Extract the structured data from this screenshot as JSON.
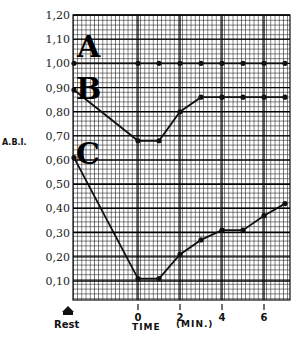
{
  "chart_data": {
    "type": "line",
    "title": "",
    "xlabel": "TIME",
    "xlabel_units": "(MIN.)",
    "ylabel": "A.B.I.",
    "ylim": [
      0.0,
      1.2
    ],
    "xlim": [
      -3,
      7.3
    ],
    "grid": true,
    "legend_position": "inline-left",
    "y_ticks": [
      "0.10",
      "0.20",
      "0.30",
      "0.40",
      "0.50",
      "0.60",
      "0.70",
      "0.80",
      "0.90",
      "1.00",
      "1.10",
      "1.20"
    ],
    "x_ticks": [
      {
        "label": "Rest",
        "value": -3
      },
      {
        "label": "0",
        "value": 0
      },
      {
        "label": "2",
        "value": 2
      },
      {
        "label": "4",
        "value": 4
      },
      {
        "label": "6",
        "value": 6
      }
    ],
    "x": [
      "Rest",
      0,
      1,
      2,
      3,
      4,
      5,
      6,
      7
    ],
    "series": [
      {
        "name": "A",
        "values": [
          1.0,
          1.0,
          1.0,
          1.0,
          1.0,
          1.0,
          1.0,
          1.0,
          1.0
        ]
      },
      {
        "name": "B",
        "values": [
          0.89,
          0.68,
          0.68,
          0.8,
          0.86,
          0.86,
          0.86,
          0.86,
          0.86
        ]
      },
      {
        "name": "C",
        "values": [
          0.61,
          0.11,
          0.11,
          0.21,
          0.27,
          0.31,
          0.31,
          0.37,
          0.42
        ]
      }
    ]
  },
  "labels": {
    "ylabel": "A.B.I.",
    "xlabel": "TIME",
    "xunits": "(MIN.)",
    "rest": "Rest",
    "series_a": "A",
    "series_b": "B",
    "series_c": "C"
  },
  "colors": {
    "line": "#111111",
    "grid": "#222222",
    "background": "#ffffff"
  }
}
